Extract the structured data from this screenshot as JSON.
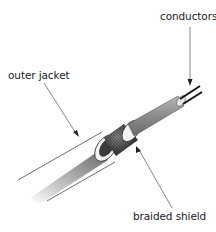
{
  "diagram": {
    "title": "",
    "labels": {
      "conductors": "conductors",
      "outer_jacket": "outer jacket",
      "braided_shield": "braided shield"
    },
    "components": [
      {
        "id": "conductors",
        "label": "conductors"
      },
      {
        "id": "outer-jacket",
        "label": "outer jacket"
      },
      {
        "id": "braided-shield",
        "label": "braided shield"
      }
    ],
    "colors": {
      "background": "#ffffff",
      "text": "#222222",
      "leader_line": "#555555",
      "jacket_outline": "#333333",
      "shield_dark": "#3a3a3a",
      "inner_insulation": "#8a8a8a",
      "conductor": "#111111"
    }
  }
}
